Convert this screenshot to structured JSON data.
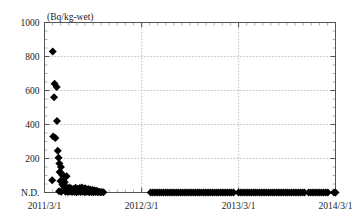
{
  "chart_data": {
    "type": "scatter",
    "title": "",
    "subtitle": "",
    "xlabel": "",
    "ylabel": "(Bq/kg-wet)",
    "y_unit_label": "(Bq/kg-wet)",
    "yticks": [
      0,
      200,
      400,
      600,
      800,
      1000
    ],
    "ytick_labels": [
      "N.D.",
      "200",
      "400",
      "600",
      "800",
      "1000"
    ],
    "ylim": [
      0,
      1000
    ],
    "xticks": [
      "2011/3/1",
      "2012/3/1",
      "2013/3/1",
      "2014/3/1"
    ],
    "xtick_labels": [
      "2011/3/1",
      "2012/3/1",
      "2013/3/1",
      "2014/3/1"
    ],
    "xlim": [
      "2011/3/1",
      "2014/3/1"
    ],
    "x_tick_days": [
      0,
      366,
      731,
      1096
    ],
    "xlim_days": [
      0,
      1096
    ],
    "grid": true,
    "grid_style": "dotted",
    "grid_color": "#b4b4b4",
    "legend": null,
    "marker": "diamond",
    "marker_color": "#000000",
    "marker_size": 4,
    "series": [
      {
        "name": "Radiocesium concentration",
        "points": [
          [
            31,
            830
          ],
          [
            38,
            640
          ],
          [
            46,
            620
          ],
          [
            36,
            560
          ],
          [
            47,
            420
          ],
          [
            33,
            330
          ],
          [
            41,
            320
          ],
          [
            50,
            245
          ],
          [
            53,
            205
          ],
          [
            56,
            170
          ],
          [
            62,
            150
          ],
          [
            57,
            120
          ],
          [
            64,
            112
          ],
          [
            68,
            100
          ],
          [
            29,
            72
          ],
          [
            60,
            68
          ],
          [
            72,
            66
          ],
          [
            76,
            60
          ],
          [
            83,
            95
          ],
          [
            67,
            48
          ],
          [
            71,
            40
          ],
          [
            74,
            35
          ],
          [
            80,
            30
          ],
          [
            86,
            26
          ],
          [
            90,
            22
          ],
          [
            94,
            30
          ],
          [
            98,
            18
          ],
          [
            101,
            24
          ],
          [
            105,
            14
          ],
          [
            109,
            20
          ],
          [
            113,
            12
          ],
          [
            117,
            28
          ],
          [
            121,
            16
          ],
          [
            125,
            22
          ],
          [
            129,
            12
          ],
          [
            133,
            26
          ],
          [
            137,
            18
          ],
          [
            141,
            30
          ],
          [
            145,
            22
          ],
          [
            149,
            16
          ],
          [
            153,
            25
          ],
          [
            157,
            18
          ],
          [
            161,
            14
          ],
          [
            165,
            20
          ],
          [
            169,
            12
          ],
          [
            173,
            16
          ],
          [
            177,
            10
          ],
          [
            181,
            14
          ],
          [
            185,
            10
          ],
          [
            189,
            12
          ],
          [
            193,
            8
          ],
          [
            197,
            10
          ],
          [
            55,
            8
          ],
          [
            63,
            5
          ],
          [
            79,
            4
          ],
          [
            88,
            3
          ],
          [
            96,
            6
          ],
          [
            104,
            3
          ],
          [
            112,
            5
          ],
          [
            120,
            2
          ],
          [
            128,
            4
          ],
          [
            136,
            3
          ],
          [
            144,
            5
          ],
          [
            152,
            2
          ],
          [
            160,
            4
          ],
          [
            168,
            2
          ],
          [
            176,
            3
          ],
          [
            184,
            2
          ],
          [
            192,
            3
          ],
          [
            200,
            2
          ],
          [
            205,
            4
          ],
          [
            210,
            2
          ],
          [
            215,
            3
          ],
          [
            222,
            2
          ],
          [
            400,
            0
          ],
          [
            408,
            0
          ],
          [
            416,
            0
          ],
          [
            424,
            0
          ],
          [
            432,
            0
          ],
          [
            440,
            0
          ],
          [
            448,
            0
          ],
          [
            456,
            0
          ],
          [
            464,
            0
          ],
          [
            472,
            0
          ],
          [
            480,
            0
          ],
          [
            488,
            0
          ],
          [
            496,
            0
          ],
          [
            504,
            0
          ],
          [
            512,
            0
          ],
          [
            520,
            0
          ],
          [
            528,
            0
          ],
          [
            536,
            0
          ],
          [
            544,
            0
          ],
          [
            552,
            0
          ],
          [
            560,
            0
          ],
          [
            568,
            0
          ],
          [
            576,
            0
          ],
          [
            584,
            0
          ],
          [
            592,
            0
          ],
          [
            600,
            0
          ],
          [
            608,
            0
          ],
          [
            616,
            0
          ],
          [
            624,
            0
          ],
          [
            632,
            0
          ],
          [
            640,
            0
          ],
          [
            648,
            0
          ],
          [
            656,
            0
          ],
          [
            664,
            0
          ],
          [
            672,
            0
          ],
          [
            680,
            0
          ],
          [
            688,
            0
          ],
          [
            696,
            0
          ],
          [
            704,
            0
          ],
          [
            712,
            0
          ],
          [
            731,
            0
          ],
          [
            739,
            0
          ],
          [
            747,
            0
          ],
          [
            755,
            0
          ],
          [
            763,
            0
          ],
          [
            771,
            0
          ],
          [
            779,
            0
          ],
          [
            787,
            0
          ],
          [
            795,
            0
          ],
          [
            803,
            0
          ],
          [
            811,
            0
          ],
          [
            819,
            0
          ],
          [
            827,
            0
          ],
          [
            835,
            0
          ],
          [
            843,
            0
          ],
          [
            851,
            0
          ],
          [
            859,
            0
          ],
          [
            867,
            0
          ],
          [
            875,
            0
          ],
          [
            883,
            0
          ],
          [
            891,
            0
          ],
          [
            899,
            0
          ],
          [
            907,
            0
          ],
          [
            915,
            0
          ],
          [
            923,
            0
          ],
          [
            931,
            0
          ],
          [
            939,
            0
          ],
          [
            947,
            0
          ],
          [
            955,
            0
          ],
          [
            963,
            0
          ],
          [
            971,
            0
          ],
          [
            979,
            0
          ],
          [
            995,
            0
          ],
          [
            1003,
            0
          ],
          [
            1011,
            0
          ],
          [
            1019,
            0
          ],
          [
            1027,
            0
          ],
          [
            1035,
            0
          ],
          [
            1043,
            0
          ],
          [
            1051,
            0
          ],
          [
            1059,
            0
          ],
          [
            1067,
            0
          ],
          [
            1090,
            0
          ],
          [
            1096,
            0
          ]
        ]
      }
    ]
  }
}
